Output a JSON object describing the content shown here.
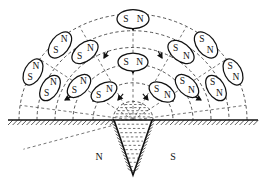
{
  "figure": {
    "type": "physics-diagram",
    "background_color": "#ffffff",
    "ink_color": "#111111",
    "width": 266,
    "height": 184
  },
  "ground": {
    "label": "ground-surface-line",
    "y": 120,
    "x_start": 8,
    "x_end": 258,
    "hatch_count": 54,
    "hatch_length": 5
  },
  "magnet": {
    "name": "buried-cone-magnet",
    "apex": {
      "x": 133,
      "y": 175
    },
    "top_left": {
      "x": 114,
      "y": 120
    },
    "top_right": {
      "x": 152,
      "y": 120
    },
    "fill_dash_rows": 13,
    "north_label": "N",
    "south_label": "S",
    "north_label_pos": {
      "x": 99,
      "y": 158
    },
    "south_label_pos": {
      "x": 173,
      "y": 158
    }
  },
  "field_lines": {
    "name": "magnetic-field-arcs",
    "style": "dashed",
    "center": {
      "x": 133,
      "y": 120
    },
    "radii": [
      20,
      40,
      60,
      78,
      96,
      114
    ],
    "count": 6
  },
  "radial_lines": {
    "name": "radial-guide-lines",
    "count": 8,
    "angles_deg": [
      8,
      35,
      62,
      90,
      118,
      145,
      172,
      196
    ]
  },
  "compass_needles": [
    {
      "id": "n-top-center",
      "cx": 133,
      "cy": 19,
      "rot": 0,
      "rx": 16,
      "ry": 9.5,
      "left_pole": "S",
      "right_pole": "N"
    },
    {
      "id": "n-mid-center",
      "cx": 133,
      "cy": 62,
      "rot": 0,
      "rx": 15,
      "ry": 9,
      "left_pole": "S",
      "right_pole": "N"
    },
    {
      "id": "n-l1-arc3",
      "cx": 60,
      "cy": 45,
      "rot": -52,
      "rx": 15,
      "ry": 9,
      "left_pole": "S",
      "right_pole": "N"
    },
    {
      "id": "n-l2-arc3",
      "cx": 85,
      "cy": 52,
      "rot": -38,
      "rx": 15,
      "ry": 9,
      "left_pole": "S",
      "right_pole": "N"
    },
    {
      "id": "n-l1-arc2",
      "cx": 33,
      "cy": 72,
      "rot": -62,
      "rx": 14,
      "ry": 8.5,
      "left_pole": "S",
      "right_pole": "N"
    },
    {
      "id": "n-l2-arc2",
      "cx": 50,
      "cy": 88,
      "rot": -58,
      "rx": 14,
      "ry": 8.5,
      "left_pole": "S",
      "right_pole": "N"
    },
    {
      "id": "n-l3-arc2",
      "cx": 79,
      "cy": 86,
      "rot": -44,
      "rx": 14,
      "ry": 8.5,
      "left_pole": "S",
      "right_pole": "N"
    },
    {
      "id": "n-l4-arc2",
      "cx": 104,
      "cy": 92,
      "rot": -30,
      "rx": 14,
      "ry": 8.5,
      "left_pole": "S",
      "right_pole": "N"
    },
    {
      "id": "n-r1-arc3",
      "cx": 206,
      "cy": 45,
      "rot": 52,
      "rx": 15,
      "ry": 9,
      "left_pole": "S",
      "right_pole": "N"
    },
    {
      "id": "n-r2-arc3",
      "cx": 181,
      "cy": 52,
      "rot": 38,
      "rx": 15,
      "ry": 9,
      "left_pole": "S",
      "right_pole": "N"
    },
    {
      "id": "n-r1-arc2",
      "cx": 233,
      "cy": 72,
      "rot": 62,
      "rx": 14,
      "ry": 8.5,
      "left_pole": "S",
      "right_pole": "N"
    },
    {
      "id": "n-r2-arc2",
      "cx": 216,
      "cy": 88,
      "rot": 58,
      "rx": 14,
      "ry": 8.5,
      "left_pole": "S",
      "right_pole": "N"
    },
    {
      "id": "n-r3-arc2",
      "cx": 187,
      "cy": 86,
      "rot": 44,
      "rx": 14,
      "ry": 8.5,
      "left_pole": "S",
      "right_pole": "N"
    },
    {
      "id": "n-r4-arc2",
      "cx": 162,
      "cy": 92,
      "rot": 30,
      "rx": 14,
      "ry": 8.5,
      "left_pole": "S",
      "right_pole": "N"
    }
  ],
  "direction_arrows": [
    {
      "id": "arrow-top-center",
      "x": 133,
      "y": 30,
      "rot": 90,
      "len": 9
    },
    {
      "id": "arrow-mid-center",
      "x": 133,
      "y": 73,
      "rot": 90,
      "len": 9
    },
    {
      "id": "arrow-l-a",
      "x": 104,
      "cyx": 0,
      "y": 58,
      "rot": 120,
      "len": 8
    },
    {
      "id": "arrow-l-b",
      "x": 65,
      "y": 100,
      "rot": 150,
      "len": 8
    },
    {
      "id": "arrow-l-c",
      "x": 93,
      "y": 101,
      "rot": 140,
      "len": 8
    },
    {
      "id": "arrow-l-d",
      "x": 118,
      "y": 100,
      "rot": 130,
      "len": 8
    },
    {
      "id": "arrow-r-a",
      "x": 162,
      "y": 58,
      "rot": 60,
      "len": 8
    },
    {
      "id": "arrow-r-b",
      "x": 201,
      "y": 100,
      "rot": 30,
      "len": 8
    },
    {
      "id": "arrow-r-c",
      "x": 173,
      "y": 101,
      "rot": 40,
      "len": 8
    },
    {
      "id": "arrow-r-d",
      "x": 148,
      "y": 100,
      "rot": 50,
      "len": 8
    }
  ]
}
